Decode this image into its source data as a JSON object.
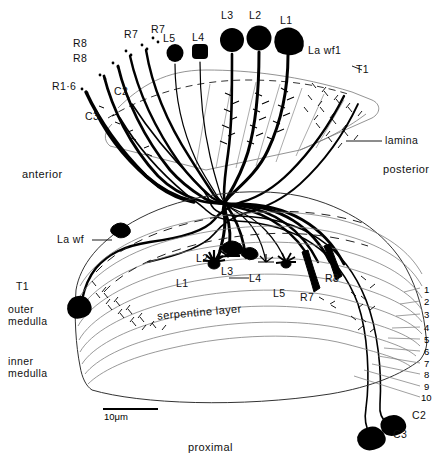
{
  "figure": {
    "orientation": {
      "anterior": "anterior",
      "posterior": "posterior",
      "proximal": "proximal"
    },
    "regions": [
      {
        "id": "lamina",
        "label": "lamina"
      },
      {
        "id": "outer-medulla",
        "label": "outer\nmedulla",
        "line1": "outer",
        "line2": "medulla"
      },
      {
        "id": "serpentine",
        "label": "serpentine layer"
      },
      {
        "id": "inner-medulla",
        "label": "inner\nmedulla",
        "line1": "inner",
        "line2": "medulla"
      }
    ],
    "scale_bar": {
      "value": "10",
      "unit": "μm",
      "text": "10μm"
    },
    "medulla_strata": [
      "1",
      "2",
      "3",
      "4",
      "5",
      "6",
      "7",
      "8",
      "9",
      "10"
    ],
    "lamina_labels": [
      {
        "name": "R1-6",
        "text": "R1·6"
      },
      {
        "name": "R8-a",
        "text": "R8"
      },
      {
        "name": "R8-b",
        "text": "R8"
      },
      {
        "name": "R7-a",
        "text": "R7"
      },
      {
        "name": "R7-b",
        "text": "R7"
      },
      {
        "name": "C2",
        "text": "C2"
      },
      {
        "name": "C3",
        "text": "C3"
      },
      {
        "name": "L5",
        "text": "L5"
      },
      {
        "name": "L4",
        "text": "L4"
      },
      {
        "name": "L3",
        "text": "L3"
      },
      {
        "name": "L2",
        "text": "L2"
      },
      {
        "name": "L1",
        "text": "L1"
      },
      {
        "name": "La-wf1",
        "text": "La wf1"
      },
      {
        "name": "T1-top",
        "text": "T1"
      }
    ],
    "medulla_labels": [
      {
        "name": "La-wf",
        "text": "La wf"
      },
      {
        "name": "T1",
        "text": "T1"
      },
      {
        "name": "L1",
        "text": "L1"
      },
      {
        "name": "L2",
        "text": "L2"
      },
      {
        "name": "L3",
        "text": "L3"
      },
      {
        "name": "L4",
        "text": "L4"
      },
      {
        "name": "L5",
        "text": "L5"
      },
      {
        "name": "R7",
        "text": "R7"
      },
      {
        "name": "R8",
        "text": "R8"
      },
      {
        "name": "C2",
        "text": "C2"
      },
      {
        "name": "C3",
        "text": "C3"
      }
    ],
    "colors": {
      "ink": "#000000",
      "outline": "#555555",
      "paper": "#ffffff"
    }
  }
}
